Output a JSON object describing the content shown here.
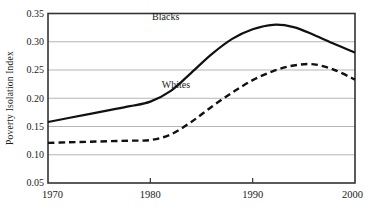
{
  "chart_data": {
    "type": "line",
    "title": "",
    "xlabel": "",
    "ylabel": "Poverty Isolation Index",
    "xlim": [
      1970,
      2000
    ],
    "ylim": [
      0.05,
      0.35
    ],
    "xticks": [
      1970,
      1980,
      1990,
      2000
    ],
    "xtick_labels": [
      "1970",
      "1980",
      "1990",
      "2000"
    ],
    "yticks": [
      0.05,
      0.1,
      0.15,
      0.2,
      0.25,
      0.3,
      0.35
    ],
    "ytick_labels": [
      "0.05",
      "0.10",
      "0.15",
      "0.20",
      "0.25",
      "0.30",
      "0.35"
    ],
    "grid": "horizontal",
    "legend_position": "inline-annotations",
    "x": [
      1970,
      1972,
      1974,
      1976,
      1978,
      1980,
      1982,
      1984,
      1986,
      1988,
      1990,
      1992,
      1994,
      1996,
      1998,
      2000
    ],
    "series": [
      {
        "name": "Blacks",
        "label": "Blacks",
        "style": "solid",
        "color": "#111111",
        "label_x": 1981.5,
        "label_y": 0.338,
        "values": [
          0.158,
          0.165,
          0.172,
          0.179,
          0.186,
          0.194,
          0.213,
          0.245,
          0.278,
          0.305,
          0.322,
          0.33,
          0.326,
          0.312,
          0.296,
          0.281
        ]
      },
      {
        "name": "Whites",
        "label": "Whites",
        "style": "dashed",
        "color": "#111111",
        "label_x": 1982.5,
        "label_y": 0.218,
        "values": [
          0.121,
          0.122,
          0.123,
          0.124,
          0.125,
          0.126,
          0.136,
          0.158,
          0.185,
          0.21,
          0.232,
          0.248,
          0.258,
          0.26,
          0.25,
          0.233
        ]
      }
    ]
  },
  "axes": {
    "frame_color": "#333333",
    "grid_color": "#b5b5b5"
  }
}
